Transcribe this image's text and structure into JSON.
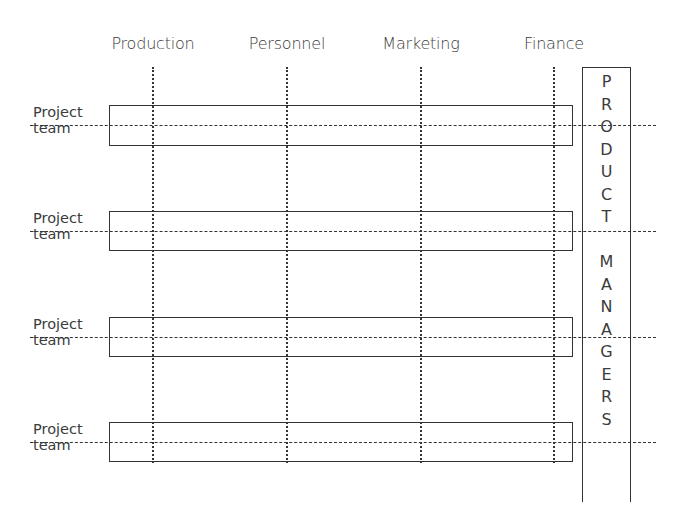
{
  "diagram": {
    "type": "matrix-organization",
    "departments": [
      {
        "label": "Production",
        "x": 153
      },
      {
        "label": "Personnel",
        "x": 287
      },
      {
        "label": "Marketing",
        "x": 421
      },
      {
        "label": "Finance",
        "x": 554
      }
    ],
    "project_teams": [
      {
        "line1": "Project",
        "line2": "team",
        "top": 105,
        "height": 41,
        "dash_y": 125
      },
      {
        "line1": "Project",
        "line2": "team",
        "top": 211,
        "height": 40,
        "dash_y": 231
      },
      {
        "line1": "Project",
        "line2": "team",
        "top": 317,
        "height": 40,
        "dash_y": 337
      },
      {
        "line1": "Project",
        "line2": "team",
        "top": 422,
        "height": 40,
        "dash_y": 442
      }
    ],
    "product_managers": {
      "word1": [
        "P",
        "R",
        "O",
        "D",
        "U",
        "C",
        "T"
      ],
      "word2": [
        "M",
        "A",
        "N",
        "A",
        "G",
        "E",
        "R",
        "S"
      ],
      "label": "PRODUCT MANAGERS"
    },
    "colors": {
      "line": "#333333",
      "text": "#3c3c3c",
      "background": "#ffffff"
    }
  }
}
